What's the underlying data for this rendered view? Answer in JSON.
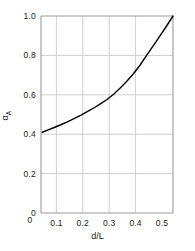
{
  "chart_data": {
    "type": "line",
    "title": "",
    "subtitle": "",
    "xlabel": "d/L",
    "ylabel": "α",
    "ylabel_subscript": "A",
    "xlim": [
      0,
      0.5
    ],
    "ylim": [
      0,
      1.0
    ],
    "xticks": [
      0,
      0.1,
      0.2,
      0.3,
      0.4,
      0.5
    ],
    "yticks": [
      0,
      0.2,
      0.4,
      0.6,
      0.8,
      1.0
    ],
    "xtick_labels": [
      "0",
      "0.1",
      "0.2",
      "0.3",
      "0.4",
      "0.5"
    ],
    "ytick_labels": [
      "0",
      "0.2",
      "0.4",
      "0.6",
      "0.8",
      "1.0"
    ],
    "grid": true,
    "grid_x_values": [
      0.1,
      0.2,
      0.3,
      0.4
    ],
    "grid_y_values": [
      0.2,
      0.4,
      0.6,
      0.8
    ],
    "legend": null,
    "legend_position": "none",
    "annotations": [],
    "series": [
      {
        "name": "alpha_A",
        "color": "#000000",
        "linewidth": 1.4,
        "x": [
          0.005,
          0.025,
          0.05,
          0.075,
          0.1,
          0.125,
          0.15,
          0.175,
          0.2,
          0.225,
          0.25,
          0.275,
          0.3,
          0.325,
          0.35,
          0.375,
          0.4,
          0.425,
          0.45,
          0.475,
          0.5
        ],
        "y": [
          0.41,
          0.421,
          0.434,
          0.448,
          0.463,
          0.479,
          0.496,
          0.514,
          0.533,
          0.554,
          0.576,
          0.603,
          0.635,
          0.669,
          0.707,
          0.75,
          0.8,
          0.848,
          0.898,
          0.948,
          1.0
        ]
      }
    ]
  },
  "colors": {
    "curve": "#000000",
    "grid": "#cfcfcf",
    "frame": "#9a9a9a",
    "text": "#1a1a1a",
    "background": "#ffffff"
  },
  "plot_box": {
    "left": 41,
    "right": 173,
    "top": 16,
    "bottom": 213
  }
}
